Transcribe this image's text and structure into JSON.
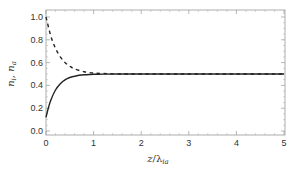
{
  "chart_data": {
    "type": "line",
    "title": "",
    "xlabel": "z/λ_ia",
    "ylabel": "n_i, n_a",
    "xlim": [
      0,
      5
    ],
    "ylim": [
      0,
      1.05
    ],
    "x_ticks": [
      "0",
      "1",
      "2",
      "3",
      "4",
      "5"
    ],
    "y_ticks": [
      "0.0",
      "0.2",
      "0.4",
      "0.6",
      "0.8",
      "1.0"
    ],
    "grid": false,
    "legend": null,
    "series": [
      {
        "name": "n_a (dashed)",
        "style": "dashed",
        "color": "#222222",
        "x": [
          0,
          0.1,
          0.2,
          0.3,
          0.4,
          0.5,
          0.6,
          0.8,
          1.0,
          1.2,
          1.5,
          2,
          3,
          4,
          5
        ],
        "values": [
          1.0,
          0.835,
          0.725,
          0.651,
          0.601,
          0.568,
          0.545,
          0.52,
          0.509,
          0.504,
          0.501,
          0.5,
          0.5,
          0.5,
          0.5
        ]
      },
      {
        "name": "n_i (solid)",
        "style": "solid",
        "color": "#222222",
        "x": [
          0,
          0.05,
          0.1,
          0.2,
          0.3,
          0.4,
          0.5,
          0.6,
          0.8,
          1.0,
          1.2,
          1.5,
          2,
          3,
          4,
          5
        ],
        "values": [
          0.12,
          0.204,
          0.27,
          0.36,
          0.415,
          0.449,
          0.469,
          0.481,
          0.493,
          0.497,
          0.499,
          0.5,
          0.5,
          0.5,
          0.5,
          0.5
        ]
      }
    ]
  },
  "labels": {
    "xlabel_main": "z",
    "xlabel_sep": "/λ",
    "xlabel_sub": "ia",
    "ylabel_a": "n",
    "ylabel_a_sub": "i",
    "ylabel_sep": ", ",
    "ylabel_b": "n",
    "ylabel_b_sub": "a"
  }
}
